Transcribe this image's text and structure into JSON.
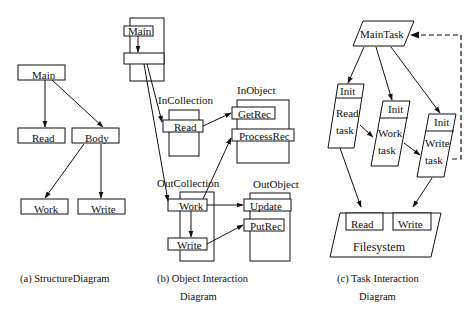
{
  "diagrams": {
    "structure": {
      "caption": "(a) StructureDiagram",
      "nodes": {
        "main": "Main",
        "read": "Read",
        "body": "Body",
        "work": "Work",
        "write": "Write"
      },
      "edges": [
        [
          "Main",
          "Read"
        ],
        [
          "Main",
          "Body"
        ],
        [
          "Body",
          "Work"
        ],
        [
          "Body",
          "Write"
        ]
      ]
    },
    "object_interaction": {
      "caption_line1": "(b) Object Interaction",
      "caption_line2": "Diagram",
      "main_object": {
        "methods": [
          "Main",
          ""
        ]
      },
      "in_collection": {
        "title": "InCollection",
        "methods": [
          "Read"
        ]
      },
      "in_object": {
        "title": "InObject",
        "methods": [
          "GetRec",
          "ProcessRec"
        ]
      },
      "out_collection": {
        "title": "OutCollection",
        "methods": [
          "Work",
          "Write"
        ]
      },
      "out_object": {
        "title": "OutObject",
        "methods": [
          "Update",
          "PutRec"
        ]
      },
      "edges": [
        [
          "Main",
          "Main.body"
        ],
        [
          "Main.body",
          "InCollection.Read"
        ],
        [
          "Main.body",
          "OutCollection.Work"
        ],
        [
          "InCollection.Read",
          "InObject.GetRec"
        ],
        [
          "OutCollection.Work",
          "InObject.ProcessRec"
        ],
        [
          "OutCollection.Work",
          "OutObject.Update"
        ],
        [
          "OutCollection.Work",
          "OutCollection.Write"
        ],
        [
          "OutCollection.Write",
          "OutObject.PutRec"
        ]
      ]
    },
    "task_interaction": {
      "caption_line1": "(c) Task Interaction",
      "caption_line2": "Diagram",
      "main_task": "MainTask",
      "tasks": [
        {
          "init": "Init",
          "body_line1": "Read",
          "body_line2": "task"
        },
        {
          "init": "Init",
          "body_line1": "Work",
          "body_line2": "task"
        },
        {
          "init": "Init",
          "body_line1": "Write",
          "body_line2": "task"
        }
      ],
      "filesystem": {
        "title": "Filesystem",
        "ports": [
          "Read",
          "Write"
        ]
      },
      "edges": [
        [
          "MainTask",
          "Read task"
        ],
        [
          "MainTask",
          "Work task"
        ],
        [
          "MainTask",
          "Write task"
        ],
        [
          "Read task",
          "Work task"
        ],
        [
          "Work task",
          "Write task"
        ],
        [
          "Read task",
          "Filesystem.Read"
        ],
        [
          "Write task",
          "Filesystem.Write"
        ],
        [
          "Write task",
          "MainTask",
          "dashed"
        ]
      ]
    }
  }
}
